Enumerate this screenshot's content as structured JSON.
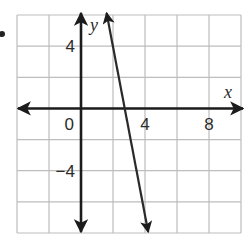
{
  "chart_data": {
    "type": "line",
    "title": "",
    "xlabel": "x",
    "ylabel": "y",
    "xlim": [
      -4,
      10
    ],
    "ylim": [
      -8,
      6
    ],
    "grid": true,
    "grid_step": 2,
    "x_tick_labels": [
      {
        "value": 0,
        "text": "0"
      },
      {
        "value": 4,
        "text": "4"
      },
      {
        "value": 8,
        "text": "8"
      }
    ],
    "y_tick_labels": [
      {
        "value": 4,
        "text": "4"
      },
      {
        "value": -4,
        "text": "−4"
      }
    ],
    "series": [
      {
        "name": "line",
        "points": [
          [
            1.63,
            6.0
          ],
          [
            2.75,
            0.0
          ],
          [
            4.2,
            -8.0
          ]
        ],
        "arrows": "both",
        "approx_slope": -5.4,
        "approx_x_intercept": 2.75
      }
    ],
    "legend": null
  },
  "colors": {
    "grid": "#bdbdbd",
    "axis": "#1c1c1c",
    "line": "#2a2a2a",
    "background": "#ffffff"
  },
  "bullet": "•"
}
